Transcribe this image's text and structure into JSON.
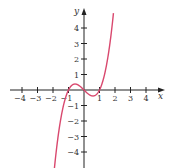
{
  "chart_data": {
    "type": "line",
    "title": "",
    "function": "y = x^3 - x",
    "xlabel": "x",
    "ylabel": "y",
    "xlim": [
      -4.5,
      5
    ],
    "ylim": [
      -4.8,
      5.2
    ],
    "x_ticks": [
      -4,
      -3,
      -2,
      -1,
      1,
      2,
      3,
      4
    ],
    "y_ticks": [
      -4,
      -3,
      -2,
      -1,
      1,
      2,
      3,
      4
    ],
    "x_tick_labels": [
      "−4",
      "−3",
      "−2",
      "−1",
      "1",
      "2",
      "3",
      "4"
    ],
    "y_tick_labels": [
      "−4",
      "−3",
      "−2",
      "−1",
      "1",
      "2",
      "3",
      "4"
    ],
    "grid": false,
    "legend": null,
    "series": [
      {
        "name": "curve",
        "color": "#d9486e",
        "x": [
          -1.9,
          -1.6,
          -1.3,
          -1.0,
          -0.8,
          -0.577,
          -0.3,
          0.0,
          0.3,
          0.577,
          0.8,
          1.0,
          1.3,
          1.6,
          1.9
        ],
        "y": [
          -4.96,
          -2.5,
          -0.9,
          0.0,
          0.29,
          0.385,
          0.27,
          0.0,
          -0.27,
          -0.385,
          -0.29,
          0.0,
          0.9,
          2.5,
          4.96
        ]
      }
    ],
    "annotations": [
      "x-intercepts at −1, 0, 1",
      "local max ≈ (−0.58, 0.38)",
      "local min ≈ (0.58, −0.38)"
    ]
  },
  "colors": {
    "axis": "#222222",
    "curve": "#d9486e",
    "background": "#ffffff"
  }
}
